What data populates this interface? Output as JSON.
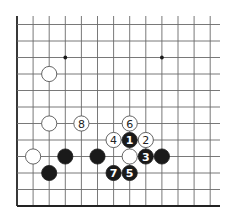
{
  "diagram": {
    "type": "go-board-diagram",
    "colors": {
      "background": "#ffffff",
      "grid": "#6a6a6a",
      "border": "#222222",
      "black_stone": "#1a1a1a",
      "white_stone": "#ffffff"
    },
    "grid": {
      "columns": 13,
      "rows": 12,
      "origin_x": 17,
      "col_spacing": 16.1,
      "bottom_y": 206,
      "row_spacing": 16.5,
      "top_extension_y": 16,
      "right_extension_x": 220,
      "edges": [
        "left",
        "bottom"
      ]
    },
    "star_points": [
      {
        "col": 3,
        "row": 9
      },
      {
        "col": 9,
        "row": 9
      }
    ],
    "stones": [
      {
        "color": "white",
        "col": 2,
        "row": 8,
        "label": ""
      },
      {
        "color": "white",
        "col": 2,
        "row": 5,
        "label": ""
      },
      {
        "color": "white",
        "col": 4,
        "row": 5,
        "label": "8"
      },
      {
        "color": "white",
        "col": 1,
        "row": 3,
        "label": ""
      },
      {
        "color": "black",
        "col": 3,
        "row": 3,
        "label": ""
      },
      {
        "color": "black",
        "col": 5,
        "row": 3,
        "label": ""
      },
      {
        "color": "black",
        "col": 2,
        "row": 2,
        "label": ""
      },
      {
        "color": "white",
        "col": 7,
        "row": 5,
        "label": "6"
      },
      {
        "color": "white",
        "col": 6,
        "row": 4,
        "label": "4"
      },
      {
        "color": "black",
        "col": 7,
        "row": 4,
        "label": "1"
      },
      {
        "color": "white",
        "col": 8,
        "row": 4,
        "label": "2"
      },
      {
        "color": "white",
        "col": 7,
        "row": 3,
        "label": ""
      },
      {
        "color": "black",
        "col": 8,
        "row": 3,
        "label": "3"
      },
      {
        "color": "black",
        "col": 9,
        "row": 3,
        "label": ""
      },
      {
        "color": "black",
        "col": 6,
        "row": 2,
        "label": "7"
      },
      {
        "color": "black",
        "col": 7,
        "row": 2,
        "label": "5"
      }
    ],
    "move_sequence": [
      "1",
      "2",
      "3",
      "4",
      "5",
      "6",
      "7",
      "8"
    ]
  }
}
